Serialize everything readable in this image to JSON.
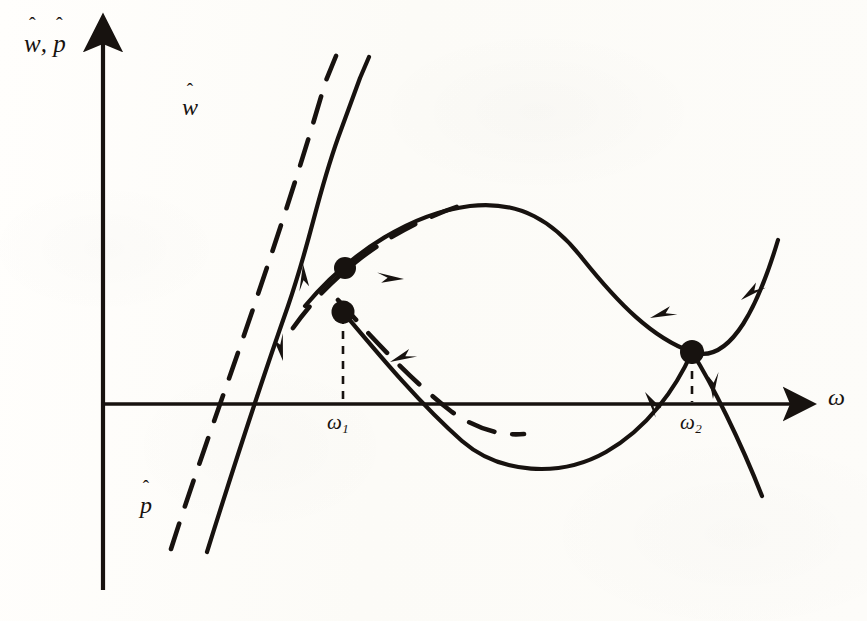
{
  "figure": {
    "kind": "phase-diagram",
    "background_color": "#fdfcfa",
    "ink_color": "#17120f",
    "axes": {
      "y_axis_label": "w, p",
      "y_axis_label_parts": {
        "first": "w",
        "separator": ", ",
        "second": "p",
        "hat": "ˆ"
      },
      "x_axis_label": "ω",
      "origin": {
        "x": 103,
        "y": 404
      },
      "y_axis_top": 30,
      "y_axis_bottom": 590,
      "x_axis_right": 800
    },
    "curves": [
      {
        "name": "w-hat-solid",
        "label": "w",
        "style": "solid",
        "description": "downward sloping wage schedule falling steeply from upper left, flattening into a trough then rising at the far right"
      },
      {
        "name": "p-hat-dashed",
        "label": "p",
        "style": "dashed",
        "description": "price schedule running just above and parallel to the w-hat schedule"
      },
      {
        "name": "hump-solid",
        "style": "solid",
        "description": "single-peaked solid curve rising from lower left, cresting near the middle, then falling to the right"
      },
      {
        "name": "hump-dashed",
        "style": "dashed",
        "description": "dashed partner of the single-peaked curve, shifted up and left of it"
      }
    ],
    "equilibria": [
      {
        "name": "upper-dot",
        "x": 345,
        "y": 268,
        "kind": "dashed-intersection"
      },
      {
        "name": "omega-1-dot",
        "x": 343,
        "y": 312,
        "kind": "solid-intersection",
        "tick_label": "ω₁"
      },
      {
        "name": "omega-2-dot",
        "x": 692,
        "y": 352,
        "kind": "solid-intersection",
        "tick_label": "ω₂"
      }
    ],
    "tick_labels": {
      "omega_1": {
        "base": "ω",
        "sub": "1"
      },
      "omega_2": {
        "base": "ω",
        "sub": "2"
      }
    },
    "direction_arrows": {
      "count": 10,
      "description": "solid arrowheads placed along the curves pointing toward the two intersection equilibria"
    }
  }
}
